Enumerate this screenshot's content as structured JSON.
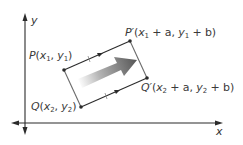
{
  "diagram": {
    "axes": {
      "x_label": "x",
      "y_label": "y"
    },
    "points": {
      "P": {
        "name": "P",
        "coord_x": "x",
        "coord_x_sub": "1",
        "coord_y": "y",
        "coord_y_sub": "1"
      },
      "Q": {
        "name": "Q",
        "coord_x": "x",
        "coord_x_sub": "2",
        "coord_y": "y",
        "coord_y_sub": "2"
      },
      "P_prime": {
        "name": "P′",
        "coord_x": "x",
        "coord_x_sub": "1",
        "shift_x": " + a, ",
        "coord_y": "y",
        "coord_y_sub": "1",
        "shift_y": " + b"
      },
      "Q_prime": {
        "name": "Q′",
        "coord_x": "x",
        "coord_x_sub": "2",
        "shift_x": " + a, ",
        "coord_y": "y",
        "coord_y_sub": "2",
        "shift_y": " + b"
      }
    },
    "colors": {
      "line": "#2b2b2b",
      "frame": "#6b6b6b",
      "arrow_dark": "#555555",
      "arrow_light": "#f2f2f2",
      "label": "#3a3a3a"
    }
  }
}
